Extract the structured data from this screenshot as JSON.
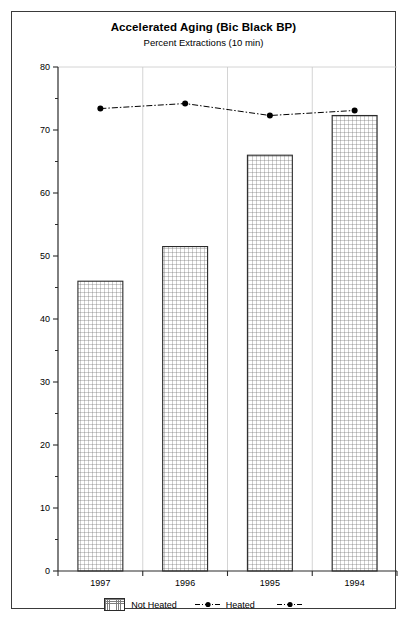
{
  "chart_data": {
    "type": "bar",
    "title": "Accelerated Aging (Bic Black BP)",
    "subtitle": "Percent Extractions (10 min)",
    "xlabel": "",
    "ylabel": "",
    "categories": [
      "1997",
      "1996",
      "1995",
      "1994"
    ],
    "ylim": [
      0,
      80
    ],
    "y_ticks": [
      0,
      10,
      20,
      30,
      40,
      50,
      60,
      70,
      80
    ],
    "y_tick_labels": [
      "0",
      "10",
      "20",
      "30",
      "40",
      "50",
      "60",
      "70",
      "80"
    ],
    "y_minor_tick_interval": 5,
    "grid": true,
    "grid_axis": "x-category-separators",
    "legend_position": "bottom-center",
    "series": [
      {
        "name": "Not Heated",
        "type": "bar",
        "values": [
          46,
          51.5,
          66,
          72.3
        ],
        "fill": "cross-hatch",
        "edge_color": "#2b2b2b"
      },
      {
        "name": "Heated",
        "type": "line",
        "values": [
          73.4,
          74.2,
          72.3,
          73.1
        ],
        "line_style": "dash-dot",
        "marker": "filled-circle",
        "color": "#000000"
      }
    ]
  },
  "legend": {
    "entries": [
      {
        "label": "Not Heated",
        "symbol": "hatched-bar-swatch"
      },
      {
        "label": "Heated",
        "symbol": "dash-dot-line-with-dot-marker"
      }
    ]
  }
}
